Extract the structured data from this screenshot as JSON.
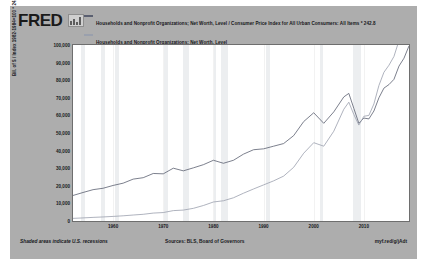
{
  "brand": {
    "name": "FRED",
    "mark": "bar-chart-logo-icon"
  },
  "legend": [
    {
      "label": "Households and Nonprofit Organizations; Net Worth, Level / Consumer Price Index for All Urban Consumers: All Items * 242.8",
      "color": "#5a5f70",
      "swatch": "line-swatch-icon"
    },
    {
      "label": "Households and Nonprofit Organizations; Net Worth, Level",
      "color": "#9aa0ad",
      "swatch": "line-swatch-icon"
    }
  ],
  "footer": {
    "recessions_note": "Shaded areas indicate U.S. recessions",
    "sources": "Sources: BLS, Board of Governors",
    "url": "myf.red/g/jAdt"
  },
  "chart_data": {
    "type": "line",
    "title": "Households and Nonprofit Organizations; Net Worth, Level / Consumer Price Index for All Urban Consumers: All Items * 242.8",
    "xlabel": "",
    "ylabel": "Bil. of $ / Index 1982-1984=100 * 242.8 , Billions of Dollars",
    "xlim": [
      1952,
      2019
    ],
    "ylim": [
      0,
      100000
    ],
    "ytick_labels": [
      "100,000",
      "90,000",
      "80,000",
      "70,000",
      "60,000",
      "50,000",
      "40,000",
      "30,000",
      "20,000",
      "10,000",
      "0"
    ],
    "ytick_values": [
      100000,
      90000,
      80000,
      70000,
      60000,
      50000,
      40000,
      30000,
      20000,
      10000,
      0
    ],
    "xtick_labels": [
      "1960",
      "1970",
      "1980",
      "1990",
      "2000",
      "2010"
    ],
    "xtick_values": [
      1960,
      1970,
      1980,
      1990,
      2000,
      2010
    ],
    "grid": false,
    "legend_position": "top",
    "recessions": [
      [
        1953.5,
        1954.4
      ],
      [
        1957.6,
        1958.3
      ],
      [
        1960.3,
        1961.1
      ],
      [
        1969.9,
        1970.9
      ],
      [
        1973.9,
        1975.2
      ],
      [
        1980.0,
        1980.5
      ],
      [
        1981.5,
        1982.9
      ],
      [
        1990.5,
        1991.2
      ],
      [
        2001.2,
        2001.9
      ],
      [
        2007.9,
        2009.5
      ]
    ],
    "series": [
      {
        "name": "Net Worth / CPI * 242.8 (real)",
        "color": "#5a5f70",
        "x": [
          1952,
          1954,
          1956,
          1958,
          1960,
          1962,
          1964,
          1966,
          1968,
          1970,
          1972,
          1974,
          1976,
          1978,
          1980,
          1982,
          1984,
          1986,
          1988,
          1990,
          1992,
          1994,
          1996,
          1998,
          2000,
          2002,
          2004,
          2006,
          2007,
          2008,
          2009,
          2010,
          2011,
          2012,
          2013,
          2014,
          2015,
          2016,
          2017,
          2018,
          2019
        ],
        "values": [
          14500,
          16200,
          17800,
          18600,
          20200,
          21500,
          23800,
          24600,
          27000,
          26800,
          30000,
          28500,
          30200,
          32000,
          34500,
          32800,
          34500,
          38000,
          40500,
          41000,
          42500,
          44000,
          48500,
          56500,
          61500,
          55500,
          62000,
          70500,
          72500,
          64000,
          55500,
          58500,
          58000,
          62500,
          70000,
          75500,
          77500,
          80500,
          88000,
          92500,
          99500
        ]
      },
      {
        "name": "Net Worth, Level (nominal)",
        "color": "#9aa0ad",
        "x": [
          1952,
          1954,
          1956,
          1958,
          1960,
          1962,
          1964,
          1966,
          1968,
          1970,
          1972,
          1974,
          1976,
          1978,
          1980,
          1982,
          1984,
          1986,
          1988,
          1990,
          1992,
          1994,
          1996,
          1998,
          2000,
          2002,
          2004,
          2006,
          2007,
          2008,
          2009,
          2010,
          2011,
          2012,
          2013,
          2014,
          2015,
          2016,
          2017,
          2018,
          2019
        ],
        "values": [
          1500,
          1750,
          2050,
          2300,
          2600,
          2950,
          3400,
          3800,
          4500,
          4800,
          5900,
          6200,
          7200,
          8800,
          10800,
          11500,
          13200,
          15800,
          18200,
          20500,
          22800,
          25500,
          30500,
          38500,
          44500,
          42500,
          51000,
          63500,
          67500,
          60500,
          54500,
          59500,
          60000,
          66500,
          77000,
          84500,
          88500,
          93500,
          102500,
          105500,
          107500
        ]
      }
    ]
  }
}
